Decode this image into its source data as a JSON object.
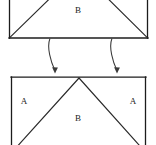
{
  "diagram": {
    "type": "geometric-decomposition",
    "canvas": {
      "width": 156,
      "height": 145,
      "background": "#ffffff"
    },
    "stroke_color": "#1c1c1c",
    "arrow_color": "#3a3a3a",
    "label_color": "#1a1a1a",
    "top_figure": {
      "name": "upper-rectangle",
      "description": "rectangle cropped at top containing an inverted-V division",
      "rect": {
        "x1": 9,
        "y1": -28,
        "x2": 148,
        "y2": 38
      },
      "apex": {
        "x": 79,
        "y": -28
      },
      "labels": [
        {
          "text": "B",
          "x": 78,
          "y": 10
        }
      ]
    },
    "arrows": [
      {
        "name": "left-arrow",
        "from": {
          "x": 50,
          "y": 39
        },
        "to": {
          "x": 55,
          "y": 73
        },
        "control": {
          "x": 46,
          "y": 58
        }
      },
      {
        "name": "right-arrow",
        "from": {
          "x": 112,
          "y": 39
        },
        "to": {
          "x": 117,
          "y": 73
        },
        "control": {
          "x": 108,
          "y": 58
        }
      }
    ],
    "bottom_figure": {
      "name": "lower-rectangle",
      "description": "rectangle cropped at bottom containing a V division creating regions A, B, A",
      "rect": {
        "x1": 11,
        "y1": 77,
        "x2": 146,
        "y2": 168
      },
      "apex": {
        "x": 79,
        "y": 78
      },
      "labels": [
        {
          "text": "A",
          "x": 24,
          "y": 101
        },
        {
          "text": "B",
          "x": 78,
          "y": 118
        },
        {
          "text": "A",
          "x": 133,
          "y": 101
        }
      ]
    }
  }
}
